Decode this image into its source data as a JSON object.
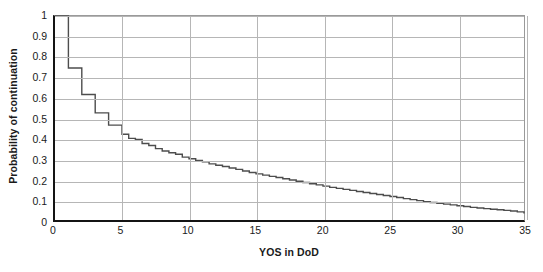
{
  "chart_data": {
    "type": "line",
    "subtype": "step",
    "title": "",
    "xlabel": "YOS in DoD",
    "ylabel": "Probability of continuation",
    "xlim": [
      0,
      35
    ],
    "ylim": [
      0,
      1
    ],
    "xticks": [
      0,
      5,
      10,
      15,
      20,
      25,
      30,
      35
    ],
    "xtick_labels": [
      "0",
      "5",
      "10",
      "15",
      "20",
      "25",
      "30",
      "35"
    ],
    "yticks": [
      0,
      0.1,
      0.2,
      0.3,
      0.4,
      0.5,
      0.6,
      0.7,
      0.8,
      0.9,
      1
    ],
    "ytick_labels": [
      "0",
      "0.1",
      "0.2",
      "0.3",
      "0.4",
      "0.5",
      "0.6",
      "0.7",
      "0.8",
      "0.9",
      "1"
    ],
    "grid": "horizontal-and-vertical",
    "legend": "none",
    "line_color": "#4d4d4d",
    "series": [
      {
        "name": "Probability of continuation",
        "x": [
          0,
          1,
          2,
          3,
          4,
          5,
          5.5,
          6,
          6.5,
          7,
          7.5,
          8,
          8.5,
          9,
          9.5,
          10,
          10.5,
          11,
          11.5,
          12,
          12.5,
          13,
          13.5,
          14,
          14.5,
          15,
          15.5,
          16,
          16.5,
          17,
          17.5,
          18,
          18.5,
          19,
          19.5,
          20,
          20.5,
          21,
          21.5,
          22,
          22.5,
          23,
          23.5,
          24,
          24.5,
          25,
          25.5,
          26,
          26.5,
          27,
          27.5,
          28,
          28.5,
          29,
          29.5,
          30,
          30.5,
          31,
          31.5,
          32,
          32.5,
          33,
          33.5,
          34,
          34.5,
          35
        ],
        "y": [
          1.0,
          0.745,
          0.615,
          0.525,
          0.465,
          0.42,
          0.4,
          0.395,
          0.375,
          0.365,
          0.35,
          0.338,
          0.33,
          0.322,
          0.308,
          0.3,
          0.292,
          0.285,
          0.275,
          0.268,
          0.262,
          0.255,
          0.248,
          0.24,
          0.233,
          0.226,
          0.22,
          0.214,
          0.208,
          0.202,
          0.196,
          0.19,
          0.184,
          0.178,
          0.172,
          0.166,
          0.16,
          0.155,
          0.15,
          0.145,
          0.14,
          0.135,
          0.13,
          0.125,
          0.12,
          0.115,
          0.11,
          0.105,
          0.1,
          0.095,
          0.09,
          0.086,
          0.082,
          0.078,
          0.074,
          0.07,
          0.066,
          0.062,
          0.059,
          0.056,
          0.053,
          0.05,
          0.047,
          0.044,
          0.04,
          0.032
        ]
      }
    ]
  }
}
